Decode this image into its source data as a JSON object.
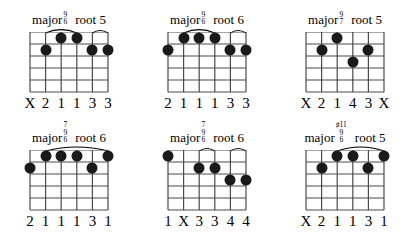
{
  "page": {
    "strings": 6,
    "frets": 5,
    "dot_color": "#1a1a1a",
    "grid_color": "#4a4a4a"
  },
  "chords": [
    {
      "id": "major-9-6-root-5",
      "quality": "major",
      "extensions": [
        "9",
        "6"
      ],
      "root": "root 5",
      "fingering": [
        "X",
        "2",
        "1",
        "1",
        "3",
        "3"
      ],
      "arcs": [
        {
          "from_string": 2,
          "to_string": 4
        },
        {
          "from_string": 5,
          "to_string": 6
        }
      ],
      "dots": [
        {
          "string": 2,
          "fret": 2
        },
        {
          "string": 3,
          "fret": 1
        },
        {
          "string": 4,
          "fret": 1
        },
        {
          "string": 5,
          "fret": 2
        },
        {
          "string": 6,
          "fret": 2
        }
      ]
    },
    {
      "id": "major-9-6-root-6",
      "quality": "major",
      "extensions": [
        "9",
        "6"
      ],
      "root": "root 6",
      "fingering": [
        "2",
        "1",
        "1",
        "1",
        "3",
        "3"
      ],
      "arcs": [
        {
          "from_string": 2,
          "to_string": 4
        },
        {
          "from_string": 5,
          "to_string": 6
        }
      ],
      "dots": [
        {
          "string": 1,
          "fret": 2
        },
        {
          "string": 2,
          "fret": 1
        },
        {
          "string": 3,
          "fret": 1
        },
        {
          "string": 4,
          "fret": 1
        },
        {
          "string": 5,
          "fret": 2
        },
        {
          "string": 6,
          "fret": 2
        }
      ]
    },
    {
      "id": "major-9-7-root-5",
      "quality": "major",
      "extensions": [
        "9",
        "7"
      ],
      "root": "root 5",
      "fingering": [
        "X",
        "2",
        "1",
        "4",
        "3",
        "X"
      ],
      "arcs": [],
      "dots": [
        {
          "string": 2,
          "fret": 2
        },
        {
          "string": 3,
          "fret": 1
        },
        {
          "string": 4,
          "fret": 3
        },
        {
          "string": 5,
          "fret": 2
        }
      ]
    },
    {
      "id": "major-7-9-6-root-6-a",
      "quality": "major",
      "extensions": [
        "7",
        "9",
        "6"
      ],
      "root": "root 6",
      "fingering": [
        "2",
        "1",
        "1",
        "1",
        "3",
        "1"
      ],
      "arcs": [
        {
          "from_string": 2,
          "to_string": 6
        }
      ],
      "dots": [
        {
          "string": 1,
          "fret": 2
        },
        {
          "string": 2,
          "fret": 1
        },
        {
          "string": 3,
          "fret": 1
        },
        {
          "string": 4,
          "fret": 1
        },
        {
          "string": 5,
          "fret": 2
        },
        {
          "string": 6,
          "fret": 1
        }
      ]
    },
    {
      "id": "major-7-9-6-root-6-b",
      "quality": "major",
      "extensions": [
        "7",
        "9",
        "6"
      ],
      "root": "root 6",
      "fingering": [
        "1",
        "X",
        "3",
        "3",
        "4",
        "4"
      ],
      "arcs": [
        {
          "from_string": 3,
          "to_string": 4
        },
        {
          "from_string": 5,
          "to_string": 6
        }
      ],
      "dots": [
        {
          "string": 1,
          "fret": 1
        },
        {
          "string": 3,
          "fret": 2
        },
        {
          "string": 4,
          "fret": 2
        },
        {
          "string": 5,
          "fret": 3
        },
        {
          "string": 6,
          "fret": 3
        }
      ]
    },
    {
      "id": "major-sharp11-9-6-root-5",
      "quality": "major",
      "extensions": [
        "♯11",
        "9",
        "6"
      ],
      "root": "root 5",
      "fingering": [
        "X",
        "2",
        "1",
        "1",
        "3",
        "1"
      ],
      "arcs": [
        {
          "from_string": 3,
          "to_string": 6
        }
      ],
      "dots": [
        {
          "string": 2,
          "fret": 2
        },
        {
          "string": 3,
          "fret": 1
        },
        {
          "string": 4,
          "fret": 1
        },
        {
          "string": 5,
          "fret": 2
        },
        {
          "string": 6,
          "fret": 1
        }
      ]
    }
  ]
}
